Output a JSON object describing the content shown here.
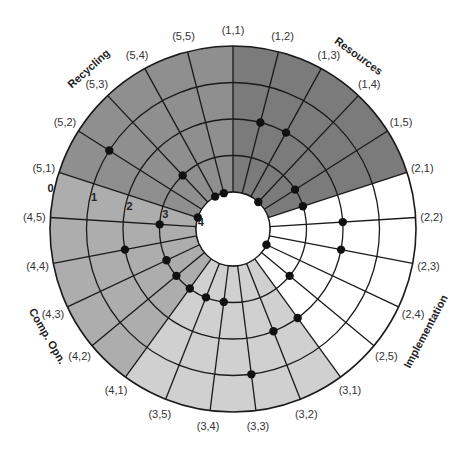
{
  "chart_data": {
    "type": "radial",
    "title": "",
    "center": [
      233,
      229
    ],
    "outer_radius": 183,
    "inner_radius": 37,
    "ring_labels": [
      "0",
      "1",
      "2",
      "3",
      "4"
    ],
    "ring_label_note": "0 = outer circle, 4 = inner circle",
    "start_angle_deg": 0,
    "spokes": [
      "(1,1)",
      "(1,2)",
      "(1,3)",
      "(1,4)",
      "(1,5)",
      "(2,1)",
      "(2,2)",
      "(2,3)",
      "(2,4)",
      "(2,5)",
      "(3,1)",
      "(3,2)",
      "(3,3)",
      "(3,4)",
      "(3,5)",
      "(4,1)",
      "(4,2)",
      "(4,3)",
      "(4,4)",
      "(4,5)",
      "(5,1)",
      "(5,2)",
      "(5,3)",
      "(5,4)",
      "(5,5)"
    ],
    "groups": [
      {
        "name": "Resources",
        "start_spoke": 0,
        "end_spoke": 5,
        "color": "#7b7b7b",
        "label_angle": 36,
        "label_radius": 210
      },
      {
        "name": "Implementation",
        "start_spoke": 5,
        "end_spoke": 10,
        "color": "#ffffff",
        "label_angle": 118,
        "label_radius": 222
      },
      {
        "name": "",
        "start_spoke": 10,
        "end_spoke": 15,
        "color": "#d0d0d0",
        "label_angle": 0,
        "label_radius": 0
      },
      {
        "name": "Comp. Opn.",
        "start_spoke": 15,
        "end_spoke": 20,
        "color": "#adadad",
        "label_angle": -120,
        "label_radius": 218
      },
      {
        "name": "Recycling",
        "start_spoke": 20,
        "end_spoke": 25,
        "color": "#8f8f8f",
        "label_angle": -42,
        "label_radius": 212
      }
    ],
    "points": [
      {
        "spoke": "(1,1)",
        "value": null
      },
      {
        "spoke": "(1,2)",
        "value": 2
      },
      {
        "spoke": "(1,3)",
        "value": 2
      },
      {
        "spoke": "(1,4)",
        "value": 4
      },
      {
        "spoke": "(1,5)",
        "value": 3
      },
      {
        "spoke": "(2,1)",
        "value": 3
      },
      {
        "spoke": "(2,2)",
        "value": 2
      },
      {
        "spoke": "(2,3)",
        "value": 2
      },
      {
        "spoke": "(2,4)",
        "value": 4
      },
      {
        "spoke": "(2,5)",
        "value": 3
      },
      {
        "spoke": "(3,1)",
        "value": 2
      },
      {
        "spoke": "(3,2)",
        "value": 2
      },
      {
        "spoke": "(3,3)",
        "value": 1
      },
      {
        "spoke": "(3,4)",
        "value": 3
      },
      {
        "spoke": "(3,5)",
        "value": 3
      },
      {
        "spoke": "(4,1)",
        "value": 3
      },
      {
        "spoke": "(4,2)",
        "value": 3
      },
      {
        "spoke": "(4,3)",
        "value": 3
      },
      {
        "spoke": "(4,4)",
        "value": 2
      },
      {
        "spoke": "(4,5)",
        "value": 3
      },
      {
        "spoke": "(5,1)",
        "value": 4
      },
      {
        "spoke": "(5,2)",
        "value": 1
      },
      {
        "spoke": "(5,3)",
        "value": 3
      },
      {
        "spoke": "(5,4)",
        "value": 4
      },
      {
        "spoke": "(5,5)",
        "value": 4
      }
    ],
    "grid": true,
    "legend": null
  }
}
